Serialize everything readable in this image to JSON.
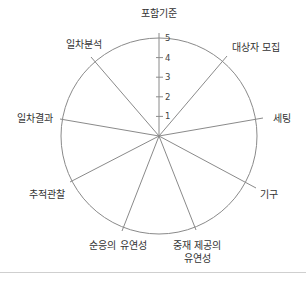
{
  "chart_data": {
    "type": "radar",
    "title": "",
    "axes": [
      {
        "label": "포함기준",
        "angle_deg": 0,
        "label_lines": [
          "포함기준"
        ],
        "label_pos": [
          159,
          17
        ],
        "anchor": "middle",
        "end": [
          159,
          33
        ]
      },
      {
        "label": "대상자 모집",
        "angle_deg": 40,
        "label_lines": [
          "대상자 모집"
        ],
        "label_pos": [
          232,
          51
        ],
        "anchor": "start",
        "end": [
          227,
          56
        ]
      },
      {
        "label": "세팅",
        "angle_deg": 80,
        "label_lines": [
          "세팅"
        ],
        "label_pos": [
          273,
          122
        ],
        "anchor": "start",
        "end": [
          263,
          118
        ]
      },
      {
        "label": "기구",
        "angle_deg": 120,
        "label_lines": [
          "기구"
        ],
        "label_pos": [
          260,
          198
        ],
        "anchor": "start",
        "end": [
          256,
          188
        ]
      },
      {
        "label": "중재 제공의 유연성",
        "angle_deg": 160,
        "label_lines": [
          "중재 제공의",
          "유연성"
        ],
        "label_pos": [
          197,
          249
        ],
        "anchor": "middle",
        "end": [
          196,
          230
        ]
      },
      {
        "label": "순응의 유연성",
        "angle_deg": 200,
        "label_lines": [
          "순응의 유연성"
        ],
        "label_pos": [
          118,
          249
        ],
        "anchor": "middle",
        "end": [
          122,
          231
        ]
      },
      {
        "label": "추적관찰",
        "angle_deg": 240,
        "label_lines": [
          "추적관찰"
        ],
        "label_pos": [
          47,
          198
        ],
        "anchor": "middle",
        "end": [
          70,
          182
        ]
      },
      {
        "label": "일차결과",
        "angle_deg": 280,
        "label_lines": [
          "일차결과"
        ],
        "label_pos": [
          35,
          122
        ],
        "anchor": "middle",
        "end": [
          60,
          119
        ]
      },
      {
        "label": "일차분석",
        "angle_deg": 320,
        "label_lines": [
          "일차분석"
        ],
        "label_pos": [
          84,
          48
        ],
        "anchor": "middle",
        "end": [
          91,
          57
        ]
      }
    ],
    "scale": {
      "min": 0,
      "max": 5,
      "ticks": [
        1,
        2,
        3,
        4,
        5
      ]
    },
    "series": [],
    "grid": "single outer circle at 5",
    "legend": "none",
    "center": [
      159,
      136
    ],
    "radius": 98,
    "colors": {
      "spoke": "#8a8a8a",
      "circle": "#8a8a8a",
      "text": "#333333",
      "divider": "#cfcfcf"
    }
  }
}
